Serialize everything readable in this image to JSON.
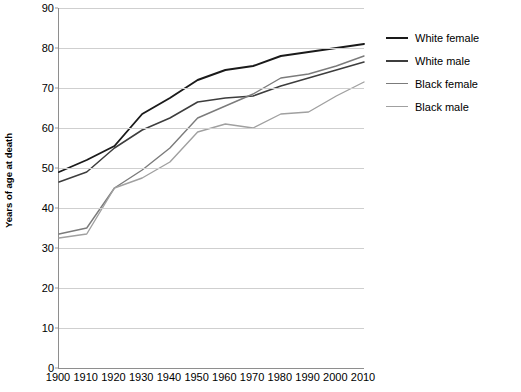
{
  "chart_data": {
    "type": "line",
    "title": "",
    "subtitle": "",
    "xlabel": "",
    "ylabel": "Years of age at death",
    "categories": [
      1900,
      1910,
      1920,
      1930,
      1940,
      1950,
      1960,
      1970,
      1980,
      1990,
      2000,
      2010
    ],
    "x_tick_labels": [
      "1900",
      "1910",
      "1920",
      "1930",
      "1940",
      "1950",
      "1960",
      "1970",
      "1980",
      "1990",
      "2000",
      "2010"
    ],
    "y_tick_labels": [
      "0",
      "10",
      "20",
      "30",
      "40",
      "50",
      "60",
      "70",
      "80",
      "90"
    ],
    "y_ticks": [
      0,
      10,
      20,
      30,
      40,
      50,
      60,
      70,
      80,
      90
    ],
    "ylim": [
      0,
      90
    ],
    "xlim": [
      1900,
      2010
    ],
    "grid": "horizontal",
    "legend_position": "right",
    "series": [
      {
        "name": "White female",
        "color": "#1a1a1a",
        "line_width": 1.9,
        "values": [
          49,
          52,
          55.5,
          63.5,
          67.5,
          72,
          74.5,
          75.5,
          78,
          79,
          80,
          81
        ]
      },
      {
        "name": "White male",
        "color": "#3d3d3d",
        "line_width": 1.5,
        "values": [
          46.5,
          49,
          55,
          59.5,
          62.5,
          66.5,
          67.5,
          68,
          70.5,
          72.5,
          74.5,
          76.5
        ]
      },
      {
        "name": "Black female",
        "color": "#7b7b7b",
        "line_width": 1.4,
        "values": [
          33.5,
          35,
          45,
          49.5,
          55,
          62.5,
          65.5,
          68.5,
          72.5,
          73.5,
          75.5,
          78
        ]
      },
      {
        "name": "Black male",
        "color": "#a0a0a0",
        "line_width": 1.4,
        "values": [
          32.5,
          33.5,
          45,
          47.5,
          51.5,
          59,
          61,
          60,
          63.5,
          64,
          68,
          71.5
        ]
      }
    ]
  },
  "legend": {
    "items": [
      {
        "label": "White female",
        "color": "#1a1a1a",
        "width": 2.4
      },
      {
        "label": "White male",
        "color": "#3d3d3d",
        "width": 2.0
      },
      {
        "label": "Black female",
        "color": "#7b7b7b",
        "width": 1.8
      },
      {
        "label": "Black male",
        "color": "#a0a0a0",
        "width": 1.8
      }
    ]
  },
  "axes": {
    "y_title": "Years of age at death",
    "axis_color": "#8e8e8e",
    "grid_color": "#cfcfcf"
  }
}
